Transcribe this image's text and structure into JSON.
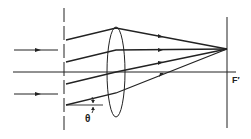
{
  "diagram": {
    "labels": {
      "focal_point": "F′",
      "angle": "θ"
    },
    "colors": {
      "line": "#222222",
      "background": "#ffffff"
    },
    "elements": [
      "incident-arrow-upper",
      "incident-arrow-lower",
      "optical-axis",
      "aperture-stop",
      "lens",
      "focal-plane",
      "ray-1",
      "ray-2",
      "ray-3",
      "ray-4",
      "angle-marker"
    ]
  }
}
